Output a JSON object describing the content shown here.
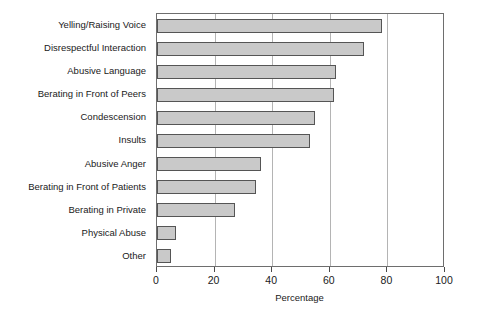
{
  "chart_data": {
    "type": "bar",
    "orientation": "horizontal",
    "title": "",
    "subtitle": "",
    "xlabel": "Percentage",
    "ylabel": "",
    "xlim": [
      0,
      100
    ],
    "xticks": [
      0,
      20,
      40,
      60,
      80,
      100
    ],
    "xtick_labels": [
      "0",
      "20",
      "40",
      "60",
      "80",
      "100"
    ],
    "grid": "vertical",
    "legend": null,
    "categories": [
      "Yelling/Raising Voice",
      "Disrespectful Interaction",
      "Abusive Language",
      "Berating in Front of Peers",
      "Condescension",
      "Insults",
      "Abusive Anger",
      "Berating in Front of Patients",
      "Berating in Private",
      "Physical Abuse",
      "Other"
    ],
    "values": [
      78,
      72,
      62,
      61.5,
      55,
      53,
      36,
      34.5,
      27,
      6.5,
      5
    ],
    "series": [
      {
        "name": "Percentage",
        "values": [
          78,
          72,
          62,
          61.5,
          55,
          53,
          36,
          34.5,
          27,
          6.5,
          5
        ]
      }
    ],
    "colors": {
      "bar_fill": "#c9c9c9",
      "bar_stroke": "#555555",
      "gridline": "#b4b4b4",
      "frame": "#6e6e6e",
      "text": "#1a1a1a",
      "background": "#ffffff"
    }
  }
}
